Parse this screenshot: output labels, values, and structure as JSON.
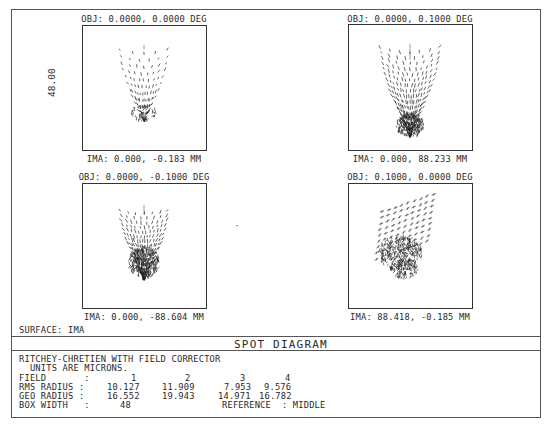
{
  "chart_data": {
    "type": "scatter",
    "title": "SPOT DIAGRAM",
    "surface": "SURFACE: IMA",
    "box_width_label": "48.00",
    "units": "MICRONS",
    "fields": [
      {
        "index": 1,
        "obj_label": "OBJ: 0.0000, 0.0000 DEG",
        "ima_label": "IMA: 0.000, -0.183 MM",
        "rms_radius": 10.127,
        "geo_radius": 16.552
      },
      {
        "index": 2,
        "obj_label": "OBJ: 0.0000, 0.1000 DEG",
        "ima_label": "IMA: 0.000, 88.233 MM",
        "rms_radius": 11.909,
        "geo_radius": 19.943
      },
      {
        "index": 3,
        "obj_label": "OBJ: 0.0000, -0.1000 DEG",
        "ima_label": "IMA: 0.000, -88.604 MM",
        "rms_radius": 7.953,
        "geo_radius": 14.971
      },
      {
        "index": 4,
        "obj_label": "OBJ: 0.1000, 0.0000 DEG",
        "ima_label": "IMA: 88.418, -0.185 MM",
        "rms_radius": 9.576,
        "geo_radius": 16.782
      }
    ],
    "box_width": 48,
    "reference": "MIDDLE"
  },
  "plots": {
    "p1": {
      "obj": "OBJ: 0.0000, 0.0000 DEG",
      "ima": "IMA: 0.000, -0.183 MM",
      "scale": "48.00"
    },
    "p2": {
      "obj": "OBJ: 0.0000, 0.1000 DEG",
      "ima": "IMA: 0.000, 88.233 MM"
    },
    "p3": {
      "obj": "OBJ: 0.0000, -0.1000 DEG",
      "ima": "IMA: 0.000, -88.604 MM"
    },
    "p4": {
      "obj": "OBJ: 0.1000, 0.0000 DEG",
      "ima": "IMA: 88.418, -0.185 MM"
    }
  },
  "surface_label": "SURFACE: IMA",
  "title": "SPOT DIAGRAM",
  "info": {
    "line1": "RITCHEY-CHRETIEN WITH FIELD CORRECTOR",
    "line2": "  UNITS ARE MICRONS.",
    "field_label": "FIELD       :",
    "field_values": [
      "1",
      "2",
      "3",
      "4"
    ],
    "rms_label": "RMS RADIUS :",
    "rms_values": [
      "10.127",
      "11.909",
      "7.953",
      "9.576"
    ],
    "geo_label": "GEO RADIUS :",
    "geo_values": [
      "16.552",
      "19.943",
      "14.971",
      "16.782"
    ],
    "box_label": "BOX WIDTH   :",
    "box_value": "48",
    "reference": "REFERENCE  : MIDDLE"
  }
}
